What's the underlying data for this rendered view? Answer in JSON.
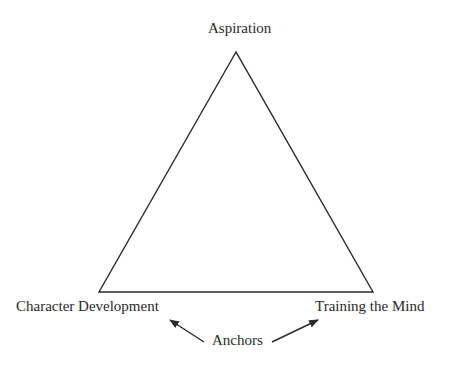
{
  "diagram": {
    "type": "triangle",
    "vertices": {
      "top": "Aspiration",
      "bottom_left": "Character Development",
      "bottom_right": "Training the Mind"
    },
    "annotation": {
      "label": "Anchors",
      "points_to": [
        "Character Development",
        "Training the Mind"
      ]
    },
    "colors": {
      "stroke": "#2a2a2a",
      "background": "#ffffff"
    }
  }
}
